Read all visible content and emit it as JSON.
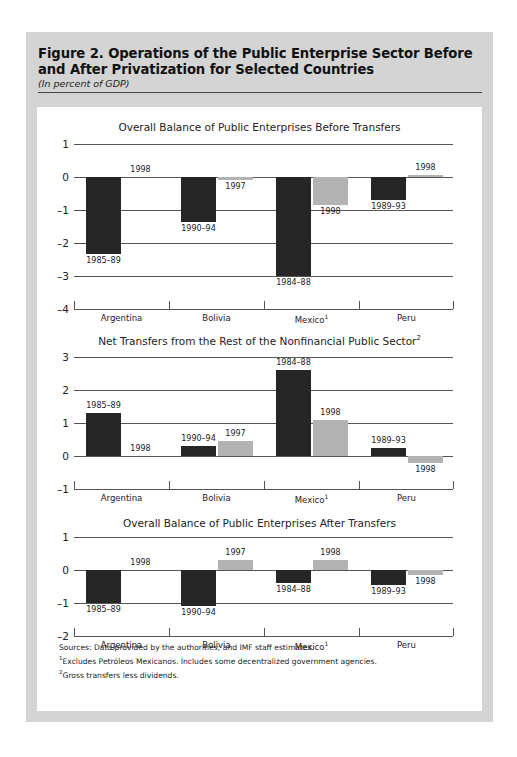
{
  "figure": {
    "title": "Figure 2.  Operations of the Public Enterprise Sector Before and After Privatization for Selected Countries",
    "subtitle": "(In percent of GDP)"
  },
  "categories": [
    "Argentina",
    "Bolivia",
    "Mexico",
    "Peru"
  ],
  "category_footnotes": [
    "",
    "",
    "1",
    ""
  ],
  "chart_data": [
    {
      "type": "bar",
      "title": "Overall Balance of Public Enterprises Before Transfers",
      "title_footnote": "",
      "xlabel": "",
      "ylabel": "",
      "ylim": [
        -4,
        1
      ],
      "yticks": [
        1,
        0,
        -1,
        -2,
        -3,
        -4
      ],
      "ytick_labels": [
        "1",
        "0",
        "–1",
        "–2",
        "–3",
        "–4"
      ],
      "categories": [
        "Argentina",
        "Bolivia",
        "Mexico",
        "Peru"
      ],
      "series": [
        {
          "name": "Before privatization",
          "color": "#262626",
          "values": [
            -2.33,
            -1.35,
            -3.0,
            -0.7
          ],
          "labels": [
            "1985–89",
            "1990–94",
            "1984–88",
            "1989–93"
          ]
        },
        {
          "name": "After privatization",
          "color": "#b3b3b3",
          "values": [
            0.0,
            -0.1,
            -0.85,
            0.05
          ],
          "labels": [
            "1998",
            "1997",
            "1998",
            "1998"
          ]
        }
      ]
    },
    {
      "type": "bar",
      "title": "Net Transfers from the Rest of the Nonfinancial Public Sector",
      "title_footnote": "2",
      "xlabel": "",
      "ylabel": "",
      "ylim": [
        -1,
        3
      ],
      "yticks": [
        3,
        2,
        1,
        0,
        -1
      ],
      "ytick_labels": [
        "3",
        "2",
        "1",
        "0",
        "–1"
      ],
      "categories": [
        "Argentina",
        "Bolivia",
        "Mexico",
        "Peru"
      ],
      "series": [
        {
          "name": "Before privatization",
          "color": "#262626",
          "values": [
            1.3,
            0.3,
            2.6,
            0.25
          ],
          "labels": [
            "1985–89",
            "1990–94",
            "1984–88",
            "1989–93"
          ]
        },
        {
          "name": "After privatization",
          "color": "#b3b3b3",
          "values": [
            0.0,
            0.45,
            1.1,
            -0.2
          ],
          "labels": [
            "1998",
            "1997",
            "1998",
            "1998"
          ]
        }
      ]
    },
    {
      "type": "bar",
      "title": "Overall Balance of Public Enterprises After Transfers",
      "title_footnote": "",
      "xlabel": "",
      "ylabel": "",
      "ylim": [
        -2,
        1
      ],
      "yticks": [
        1,
        0,
        -1,
        -2
      ],
      "ytick_labels": [
        "1",
        "0",
        "–1",
        "–2"
      ],
      "categories": [
        "Argentina",
        "Bolivia",
        "Mexico",
        "Peru"
      ],
      "series": [
        {
          "name": "Before privatization",
          "color": "#262626",
          "values": [
            -1.0,
            -1.1,
            -0.4,
            -0.45
          ],
          "labels": [
            "1985–89",
            "1990–94",
            "1984–88",
            "1989–93"
          ]
        },
        {
          "name": "After privatization",
          "color": "#b3b3b3",
          "values": [
            0.0,
            0.3,
            0.3,
            -0.15
          ],
          "labels": [
            "1998",
            "1997",
            "1998",
            "1998"
          ]
        }
      ]
    }
  ],
  "notes": {
    "sources": "Sources:  Data provided by the authorities; and IMF staff estimates.",
    "footnote1_mark": "1",
    "footnote1": "Excludes Petróleos Mexicanos. Includes some decentralized government agencies.",
    "footnote2_mark": "2",
    "footnote2": "Gross transfers less dividends."
  }
}
